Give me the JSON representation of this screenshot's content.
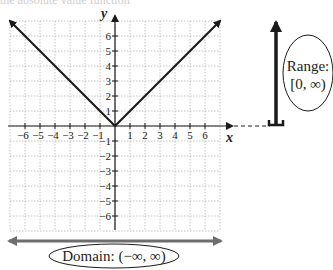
{
  "caption": "the absolute value function",
  "graph": {
    "function": "y = |x|",
    "x_axis_label": "x",
    "y_axis_label": "y",
    "x_ticks": [
      "−6",
      "−5",
      "−4",
      "−3",
      "−2",
      "−1",
      "1",
      "2",
      "3",
      "4",
      "5",
      "6"
    ],
    "y_ticks_positive": [
      "6",
      "5",
      "4",
      "3",
      "2",
      "1"
    ],
    "y_ticks_negative": [
      "−1",
      "−2",
      "−3",
      "−4",
      "−5",
      "−6"
    ],
    "range": [
      -7,
      7
    ],
    "grid": true
  },
  "domain_label": "Domain: (−∞, ∞)",
  "range_label_line1": "Range:",
  "range_label_line2": "[0, ∞)",
  "colors": {
    "graph_line": "#1a1a1a",
    "domain_arrow": "#6e6e6e",
    "range_arrow": "#1a1a1a",
    "grid": "#b5b5b5"
  }
}
